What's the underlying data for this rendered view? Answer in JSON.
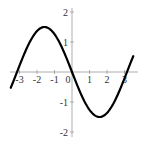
{
  "chart_data": {
    "type": "line",
    "title": "",
    "xlabel": "",
    "ylabel": "",
    "function": "y = -1.5 sin(x)",
    "xlim": [
      -3.5,
      3.5
    ],
    "ylim": [
      -2,
      2
    ],
    "grid": false,
    "legend": null,
    "x_ticks": [
      -3,
      -2,
      -1,
      0,
      1,
      2,
      3
    ],
    "x_tick_labels": [
      "-3",
      "-2",
      "-1",
      "0",
      "1",
      "2",
      "3"
    ],
    "y_ticks": [
      -2,
      -1,
      1,
      2
    ],
    "y_tick_labels": [
      "-2",
      "-1",
      "1",
      "2"
    ],
    "series": [
      {
        "name": "curve",
        "color": "#000000",
        "x": [
          -3.5,
          -3.0,
          -2.5,
          -2.0,
          -1.57,
          -1.0,
          -0.5,
          0.0,
          0.5,
          1.0,
          1.57,
          2.0,
          2.5,
          3.0,
          3.5
        ],
        "y": [
          -0.53,
          0.21,
          0.9,
          1.36,
          1.5,
          1.26,
          0.72,
          0.0,
          -0.72,
          -1.26,
          -1.5,
          -1.36,
          -0.9,
          -0.21,
          0.53
        ]
      }
    ]
  },
  "axes": {
    "color": "#999999"
  }
}
